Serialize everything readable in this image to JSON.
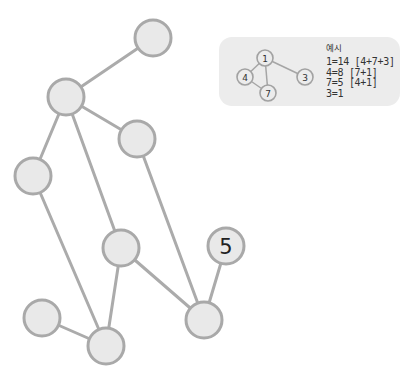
{
  "colors": {
    "node_fill": "#e9e9e9",
    "node_stroke": "#a9a9a9",
    "edge": "#ababab",
    "example_bg": "#ececec",
    "text": "#333333"
  },
  "graph": {
    "nodes": [
      {
        "id": "A",
        "x": 153,
        "y": 38,
        "label": ""
      },
      {
        "id": "B",
        "x": 66,
        "y": 97,
        "label": ""
      },
      {
        "id": "C",
        "x": 137,
        "y": 139,
        "label": ""
      },
      {
        "id": "D",
        "x": 33,
        "y": 176,
        "label": ""
      },
      {
        "id": "E",
        "x": 121,
        "y": 248,
        "label": ""
      },
      {
        "id": "N5",
        "x": 226,
        "y": 246,
        "label": "5"
      },
      {
        "id": "F",
        "x": 204,
        "y": 320,
        "label": ""
      },
      {
        "id": "G",
        "x": 42,
        "y": 318,
        "label": ""
      },
      {
        "id": "H",
        "x": 106,
        "y": 346,
        "label": ""
      }
    ],
    "edges": [
      [
        "A",
        "B"
      ],
      [
        "B",
        "C"
      ],
      [
        "B",
        "D"
      ],
      [
        "B",
        "E"
      ],
      [
        "C",
        "F"
      ],
      [
        "D",
        "H"
      ],
      [
        "E",
        "H"
      ],
      [
        "E",
        "F"
      ],
      [
        "G",
        "H"
      ],
      [
        "N5",
        "F"
      ]
    ],
    "given_label": "5"
  },
  "example": {
    "title": "예시",
    "mini_nodes": [
      {
        "id": "1",
        "x": 46,
        "y": 21,
        "label": "1"
      },
      {
        "id": "4",
        "x": 26,
        "y": 40,
        "label": "4"
      },
      {
        "id": "3",
        "x": 86,
        "y": 40,
        "label": "3"
      },
      {
        "id": "7",
        "x": 49,
        "y": 56,
        "label": "7"
      }
    ],
    "mini_edges": [
      [
        "1",
        "4"
      ],
      [
        "1",
        "7"
      ],
      [
        "1",
        "3"
      ],
      [
        "4",
        "7"
      ]
    ],
    "lines": [
      "1=14 [4+7+3]",
      "4=8 [7+1]",
      "7=5 [4+1]",
      "3=1"
    ]
  }
}
